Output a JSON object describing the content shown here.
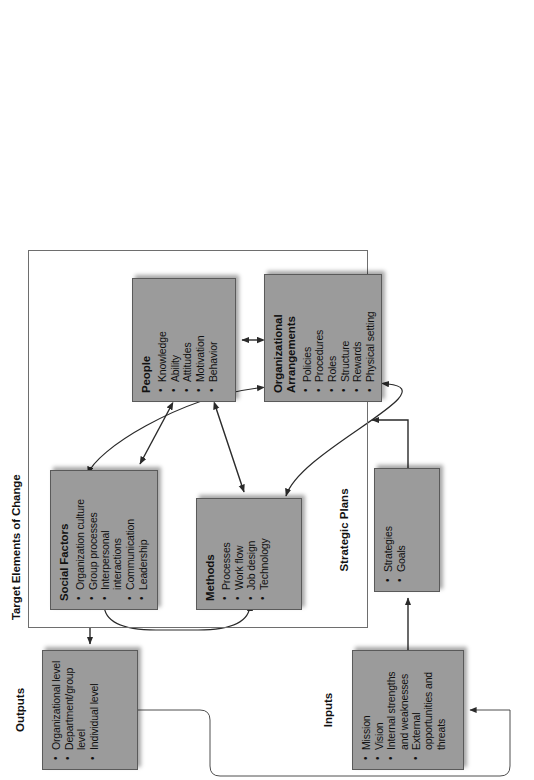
{
  "diagram": {
    "orientation": "rotated-90-ccw",
    "group": {
      "label": "Target Elements of Change"
    },
    "nodes": {
      "inputs": {
        "title": "Inputs",
        "title_position": "outside",
        "items": [
          "Mission",
          "Vision",
          "Internal strengths and weaknesses",
          "External opportunities and threats"
        ]
      },
      "strategic_plans": {
        "title": "Strategic Plans",
        "title_position": "outside",
        "items": [
          "Strategies",
          "Goals"
        ]
      },
      "organizational_arrangements": {
        "title": "Organizational Arrangements",
        "title_position": "inside",
        "items": [
          "Policies",
          "Procedures",
          "Roles",
          "Structure",
          "Rewards",
          "Physical setting"
        ]
      },
      "people": {
        "title": "People",
        "title_position": "inside",
        "items": [
          "Knowledge",
          "Ability",
          "Attitudes",
          "Motivation",
          "Behavior"
        ]
      },
      "social_factors": {
        "title": "Social Factors",
        "title_position": "inside",
        "items": [
          "Organization culture",
          "Group processes",
          "Interpersonal interactions",
          "Communication",
          "Leadership"
        ]
      },
      "methods": {
        "title": "Methods",
        "title_position": "inside",
        "items": [
          "Processes",
          "Work flow",
          "Job design",
          "Technology"
        ]
      },
      "outputs": {
        "title": "Outputs",
        "title_position": "outside",
        "items": [
          "Organizational level",
          "Department/group level",
          "Individual level"
        ]
      }
    },
    "connections": [
      {
        "from": "inputs",
        "to": "strategic_plans",
        "style": "arrow"
      },
      {
        "from": "strategic_plans",
        "to": "target_elements_group",
        "style": "arrow"
      },
      {
        "from": "target_elements_group",
        "to": "outputs",
        "style": "arrow"
      },
      {
        "from": "outputs",
        "to": "inputs",
        "style": "feedback-loop"
      },
      {
        "from": "organizational_arrangements",
        "to": "people",
        "style": "double-arrow"
      },
      {
        "from": "people",
        "to": "social_factors",
        "style": "double-arrow"
      },
      {
        "from": "people",
        "to": "methods",
        "style": "double-arrow"
      },
      {
        "from": "organizational_arrangements",
        "to": "social_factors",
        "style": "double-arrow-curve"
      },
      {
        "from": "organizational_arrangements",
        "to": "methods",
        "style": "double-arrow-curve"
      },
      {
        "from": "social_factors",
        "to": "methods",
        "style": "double-arrow-curve"
      }
    ],
    "colors": {
      "node_fill": "#9b9b9b",
      "node_border": "#5a5a5a",
      "line": "#2a2a2a",
      "text": "#111111",
      "background": "#ffffff"
    }
  }
}
